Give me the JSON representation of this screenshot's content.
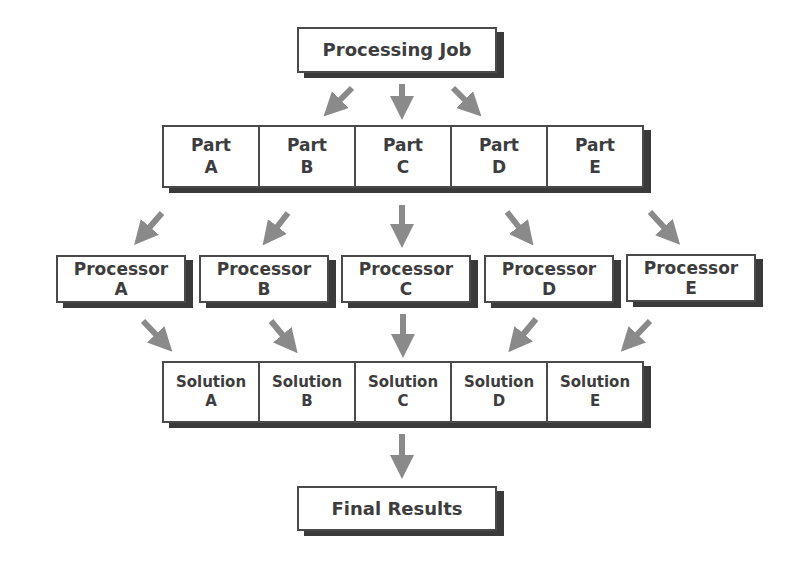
{
  "diagram": {
    "type": "parallel-processing-flow",
    "top": {
      "label": "Processing Job"
    },
    "parts": [
      {
        "line1": "Part",
        "line2": "A"
      },
      {
        "line1": "Part",
        "line2": "B"
      },
      {
        "line1": "Part",
        "line2": "C"
      },
      {
        "line1": "Part",
        "line2": "D"
      },
      {
        "line1": "Part",
        "line2": "E"
      }
    ],
    "processors": [
      {
        "line1": "Processor",
        "line2": "A"
      },
      {
        "line1": "Processor",
        "line2": "B"
      },
      {
        "line1": "Processor",
        "line2": "C"
      },
      {
        "line1": "Processor",
        "line2": "D"
      },
      {
        "line1": "Processor",
        "line2": "E"
      }
    ],
    "solutions": [
      {
        "line1": "Solution",
        "line2": "A"
      },
      {
        "line1": "Solution",
        "line2": "B"
      },
      {
        "line1": "Solution",
        "line2": "C"
      },
      {
        "line1": "Solution",
        "line2": "D"
      },
      {
        "line1": "Solution",
        "line2": "E"
      }
    ],
    "bottom": {
      "label": "Final Results"
    },
    "edges": [
      {
        "from": "Processing Job",
        "to": "Parts"
      },
      {
        "from": "Part A",
        "to": "Processor A"
      },
      {
        "from": "Part B",
        "to": "Processor B"
      },
      {
        "from": "Part C",
        "to": "Processor C"
      },
      {
        "from": "Part D",
        "to": "Processor D"
      },
      {
        "from": "Part E",
        "to": "Processor E"
      },
      {
        "from": "Processor A",
        "to": "Solution A"
      },
      {
        "from": "Processor B",
        "to": "Solution B"
      },
      {
        "from": "Processor C",
        "to": "Solution C"
      },
      {
        "from": "Processor D",
        "to": "Solution D"
      },
      {
        "from": "Processor E",
        "to": "Solution E"
      },
      {
        "from": "Solutions",
        "to": "Final Results"
      }
    ],
    "colors": {
      "border": "#4a4a4a",
      "shadow": "#3a3a3a",
      "text": "#3d3d3d",
      "arrow": "#8a8a8a",
      "background": "#ffffff"
    }
  }
}
